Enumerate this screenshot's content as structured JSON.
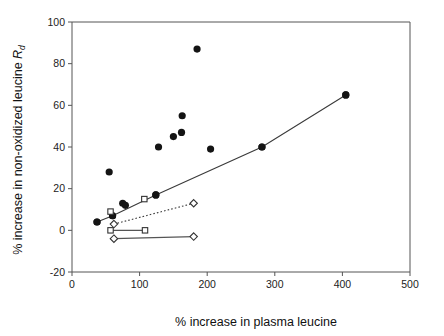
{
  "chart_data": {
    "type": "scatter",
    "title": "",
    "xlabel": "% increase in plasma leucine",
    "ylabel": "% increase in non-oxidized leucine",
    "ylabel_symbol": "R",
    "ylabel_symbol_sub": "d",
    "xlim": [
      0,
      500
    ],
    "ylim": [
      -20,
      100
    ],
    "xticks": [
      0,
      100,
      200,
      300,
      400,
      500
    ],
    "yticks": [
      -20,
      0,
      20,
      40,
      60,
      80,
      100
    ],
    "xtick_labels": [
      "0",
      "100",
      "200",
      "300",
      "400",
      "500"
    ],
    "ytick_labels": [
      "-20",
      "0",
      "20",
      "40",
      "60",
      "80",
      "100"
    ],
    "grid": false,
    "legend": "none",
    "series": [
      {
        "name": "filled-circles-scatter",
        "marker": "filled-circle",
        "color": "#141414",
        "line": "none",
        "points": [
          {
            "x": 37,
            "y": 4
          },
          {
            "x": 55,
            "y": 28
          },
          {
            "x": 60,
            "y": 7
          },
          {
            "x": 75,
            "y": 13
          },
          {
            "x": 79,
            "y": 12
          },
          {
            "x": 128,
            "y": 40
          },
          {
            "x": 124,
            "y": 17
          },
          {
            "x": 150,
            "y": 45
          },
          {
            "x": 162,
            "y": 47
          },
          {
            "x": 163,
            "y": 55
          },
          {
            "x": 185,
            "y": 87
          },
          {
            "x": 205,
            "y": 39
          },
          {
            "x": 281,
            "y": 40
          },
          {
            "x": 405,
            "y": 65
          }
        ]
      },
      {
        "name": "filled-circles-connected",
        "marker": "filled-circle",
        "color": "#141414",
        "line": "solid",
        "points": [
          {
            "x": 37,
            "y": 4
          },
          {
            "x": 60,
            "y": 7
          },
          {
            "x": 124,
            "y": 17
          },
          {
            "x": 281,
            "y": 40
          },
          {
            "x": 405,
            "y": 65
          }
        ]
      },
      {
        "name": "open-squares-upper",
        "marker": "open-square",
        "color": "#ffffff",
        "line": "none",
        "points": [
          {
            "x": 57,
            "y": 9
          },
          {
            "x": 107,
            "y": 15
          }
        ]
      },
      {
        "name": "open-diamonds-dotted",
        "marker": "open-diamond",
        "color": "#ffffff",
        "line": "dotted",
        "points": [
          {
            "x": 62,
            "y": 3
          },
          {
            "x": 180,
            "y": 13
          }
        ]
      },
      {
        "name": "open-squares-flat",
        "marker": "open-square",
        "color": "#ffffff",
        "line": "solid",
        "points": [
          {
            "x": 57,
            "y": 0
          },
          {
            "x": 108,
            "y": 0
          }
        ]
      },
      {
        "name": "open-diamonds-flat",
        "marker": "open-diamond",
        "color": "#ffffff",
        "line": "solid",
        "points": [
          {
            "x": 62,
            "y": -4
          },
          {
            "x": 180,
            "y": -3
          }
        ]
      }
    ]
  },
  "style": {
    "axis_color": "#555555",
    "marker_fill": "#141414",
    "marker_stroke": "#333333",
    "background": "#ffffff"
  }
}
